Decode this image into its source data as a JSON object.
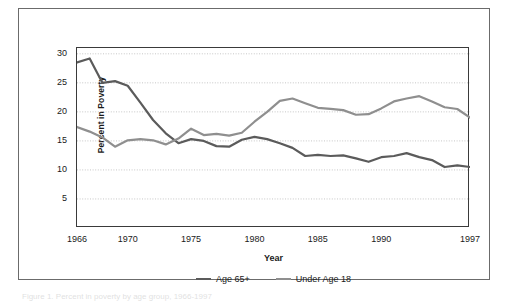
{
  "figure": {
    "caption_fragment": "Figure 1. Percent in poverty by age group, 1966-1997"
  },
  "chart_data": {
    "type": "line",
    "title": "",
    "subtitle": "",
    "xlabel": "Year",
    "ylabel": "Percent in Poverty",
    "xlim": [
      1966,
      1997
    ],
    "ylim": [
      0,
      31
    ],
    "grid": true,
    "grid_axis": "y",
    "legend_position": "bottom-center",
    "y_ticks": [
      5,
      10,
      15,
      20,
      25,
      30
    ],
    "y_tick_labels": [
      "5",
      "10",
      "15",
      "20",
      "25",
      "30"
    ],
    "x_ticks": [
      1966,
      1970,
      1975,
      1980,
      1985,
      1990,
      1997
    ],
    "x_tick_labels": [
      "1966",
      "1970",
      "1975",
      "1980",
      "1985",
      "1990",
      "1997"
    ],
    "x": [
      1966,
      1967,
      1968,
      1969,
      1970,
      1971,
      1972,
      1973,
      1974,
      1975,
      1976,
      1977,
      1978,
      1979,
      1980,
      1981,
      1982,
      1983,
      1984,
      1985,
      1986,
      1987,
      1988,
      1989,
      1990,
      1991,
      1992,
      1993,
      1994,
      1995,
      1996,
      1997
    ],
    "series": [
      {
        "name": "Age 65+",
        "color": "#5b5b5b",
        "values": [
          28.5,
          29.2,
          25.0,
          25.3,
          24.5,
          21.6,
          18.6,
          16.3,
          14.6,
          15.3,
          15.0,
          14.1,
          14.0,
          15.2,
          15.7,
          15.3,
          14.6,
          13.8,
          12.4,
          12.6,
          12.4,
          12.5,
          12.0,
          11.4,
          12.2,
          12.4,
          12.9,
          12.2,
          11.7,
          10.5,
          10.8,
          10.5
        ]
      },
      {
        "name": "Under Age 18",
        "color": "#8f8f8f",
        "values": [
          17.4,
          16.6,
          15.6,
          14.0,
          15.1,
          15.3,
          15.1,
          14.4,
          15.4,
          17.1,
          16.0,
          16.2,
          15.9,
          16.4,
          18.3,
          20.0,
          21.9,
          22.3,
          21.5,
          20.7,
          20.5,
          20.3,
          19.5,
          19.6,
          20.6,
          21.8,
          22.3,
          22.7,
          21.8,
          20.8,
          20.5,
          19.0
        ]
      }
    ],
    "annotations": []
  }
}
